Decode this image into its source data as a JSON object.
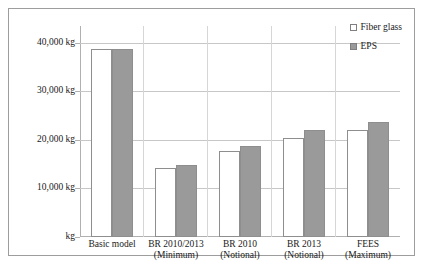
{
  "chart_data": {
    "type": "bar",
    "title": "",
    "xlabel": "",
    "ylabel": "",
    "ylim": [
      0,
      43500
    ],
    "grid": true,
    "legend_position": "top-right",
    "y_tick_labels": [
      "40,000 kg",
      "30,000 kg",
      "20,000 kg",
      "10,000 kg",
      "kg"
    ],
    "y_tick_values": [
      40000,
      30000,
      20000,
      10000,
      0
    ],
    "categories": [
      "Basic model",
      "BR 2010/2013 (Minimum)",
      "BR 2010 (Notional)",
      "BR 2013 (Notional)",
      "FEES (Maximum)"
    ],
    "category_lines": [
      {
        "line1": "Basic model",
        "line2": ""
      },
      {
        "line1": "BR 2010/2013",
        "line2": "(Minimum)"
      },
      {
        "line1": "BR 2010",
        "line2": "(Notional)"
      },
      {
        "line1": "BR 2013",
        "line2": "(Notional)"
      },
      {
        "line1": "FEES",
        "line2": "(Maximum)"
      }
    ],
    "series": [
      {
        "name": "Fiber glass",
        "color": "#ffffff",
        "values": [
          38800,
          14200,
          17700,
          20400,
          22000
        ]
      },
      {
        "name": "EPS",
        "color": "#9a9a9a",
        "values": [
          38800,
          14800,
          18800,
          22000,
          23700
        ]
      }
    ]
  },
  "legend": {
    "items": [
      {
        "label": "Fiber glass",
        "swatch": "fiber"
      },
      {
        "label": "EPS",
        "swatch": "eps"
      }
    ]
  },
  "colors": {
    "fiber_glass": "#ffffff",
    "eps": "#9a9a9a",
    "gridline": "#c7c7c7",
    "border": "#9d9d9d",
    "text": "#1a1a1a"
  }
}
